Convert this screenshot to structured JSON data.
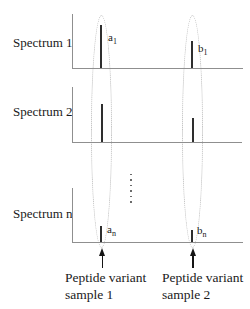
{
  "figure": {
    "type": "aligned-mass-spectra-diagram",
    "spectra": [
      {
        "label": "Spectrum 1",
        "peaks": [
          {
            "label": "a",
            "sub": "1",
            "x": 100,
            "height": 43
          },
          {
            "label": "b",
            "sub": "1",
            "x": 191,
            "height": 27
          }
        ]
      },
      {
        "label": "Spectrum 2",
        "peaks": [
          {
            "label": "",
            "sub": "",
            "x": 101,
            "height": 38
          },
          {
            "label": "",
            "sub": "",
            "x": 192,
            "height": 24
          }
        ]
      },
      {
        "label": "Spectrum n",
        "peaks": [
          {
            "label": "a",
            "sub": "n",
            "x": 100,
            "height": 16
          },
          {
            "label": "b",
            "sub": "n",
            "x": 191,
            "height": 12
          }
        ]
      }
    ],
    "annotations": [
      {
        "line1": "Peptide variant",
        "line2": "sample 1"
      },
      {
        "line1": "Peptide variant",
        "line2": "sample 2"
      }
    ],
    "colors": {
      "axis": "#8f8f8f",
      "peak": "#2e2e2e",
      "ellipse": "#b3b3b3",
      "text": "#1a1a1a"
    }
  }
}
